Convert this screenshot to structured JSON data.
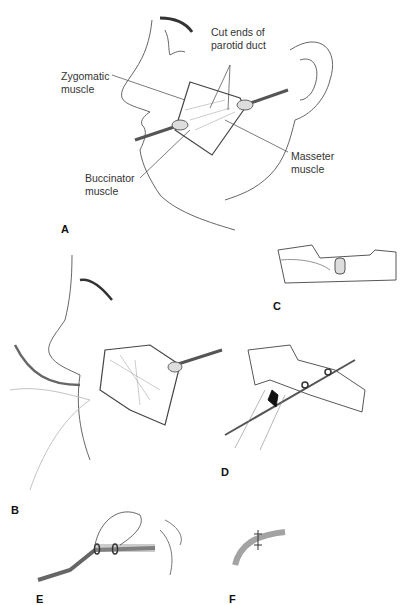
{
  "figure": {
    "panels": [
      {
        "id": "A",
        "label": "A"
      },
      {
        "id": "B",
        "label": "B"
      },
      {
        "id": "C",
        "label": "C"
      },
      {
        "id": "D",
        "label": "D"
      },
      {
        "id": "E",
        "label": "E"
      },
      {
        "id": "F",
        "label": "F"
      }
    ],
    "panel_a": {
      "annotations": {
        "cut_ends_line1": "Cut ends of",
        "cut_ends_line2": "parotid duct",
        "zygomatic_line1": "Zygomatic",
        "zygomatic_line2": "muscle",
        "buccinator_line1": "Buccinator",
        "buccinator_line2": "muscle",
        "masseter_line1": "Masseter",
        "masseter_line2": "muscle"
      }
    }
  }
}
